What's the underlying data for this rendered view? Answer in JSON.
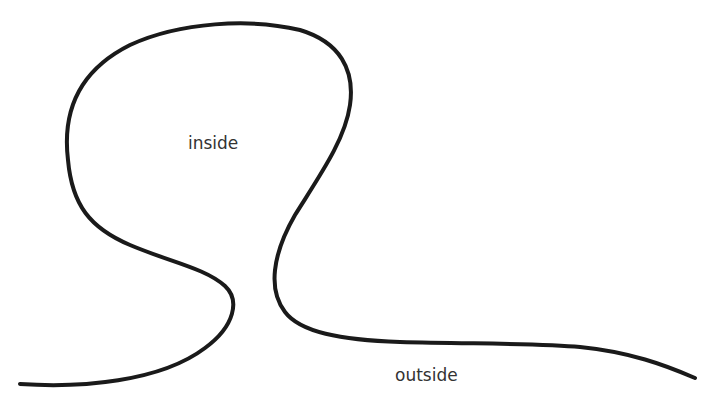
{
  "diagram": {
    "type": "closed-and-open-curve-region-illustration",
    "labels": {
      "inside": "inside",
      "outside": "outside"
    },
    "colors": {
      "stroke": "#1a1a1a",
      "text": "#333333",
      "background": "#ffffff"
    }
  }
}
